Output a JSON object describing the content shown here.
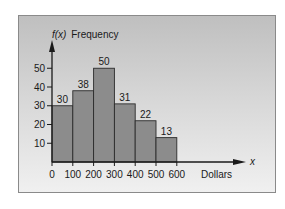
{
  "chart_data": {
    "type": "bar",
    "subtype": "histogram",
    "title": "",
    "ylabel": "f(x) Frequency",
    "ylabel_func": "f(x)",
    "ylabel_word": "Frequency",
    "xlabel": "Dollars",
    "x_axis_var": "x",
    "bin_edges": [
      0,
      100,
      200,
      300,
      400,
      500,
      600
    ],
    "x_tick_labels": [
      "0",
      "100",
      "200",
      "300",
      "400",
      "500",
      "600"
    ],
    "y_ticks": [
      10,
      20,
      30,
      40,
      50
    ],
    "y_tick_labels": [
      "10",
      "20",
      "30",
      "40",
      "50"
    ],
    "categories": [
      "0-100",
      "100-200",
      "200-300",
      "300-400",
      "400-500",
      "500-600"
    ],
    "values": [
      30,
      38,
      50,
      31,
      22,
      13
    ],
    "data_labels": [
      "30",
      "38",
      "50",
      "31",
      "22",
      "13"
    ],
    "ylim": [
      0,
      60
    ],
    "xlim": [
      0,
      700
    ],
    "grid": false,
    "legend": null,
    "colors": {
      "bar": "#8c8c8c",
      "bar_edge": "#2b2b2b",
      "axis": "#1a1a1a"
    }
  }
}
